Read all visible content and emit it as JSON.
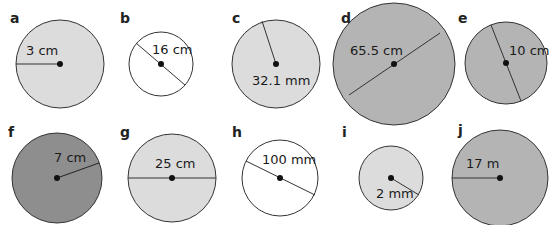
{
  "colors": {
    "white": "#ffffff",
    "light_gray": "#dcdcdc",
    "mid_gray": "#b4b4b4",
    "dark_gray": "#8e8e8e",
    "stroke": "#333333"
  },
  "circles": [
    {
      "letter": "a",
      "label": "3 cm",
      "fill": "#dcdcdc"
    },
    {
      "letter": "b",
      "label": "16 cm",
      "fill": "#ffffff"
    },
    {
      "letter": "c",
      "label": "32.1 mm",
      "fill": "#dcdcdc"
    },
    {
      "letter": "d",
      "label": "65.5 cm",
      "fill": "#b4b4b4"
    },
    {
      "letter": "e",
      "label": "10 cm",
      "fill": "#b4b4b4"
    },
    {
      "letter": "f",
      "label": "7 cm",
      "fill": "#8e8e8e"
    },
    {
      "letter": "g",
      "label": "25 cm",
      "fill": "#dcdcdc"
    },
    {
      "letter": "h",
      "label": "100 mm",
      "fill": "#ffffff"
    },
    {
      "letter": "i",
      "label": "2 mm",
      "fill": "#dcdcdc"
    },
    {
      "letter": "j",
      "label": "17 m",
      "fill": "#b4b4b4"
    }
  ]
}
